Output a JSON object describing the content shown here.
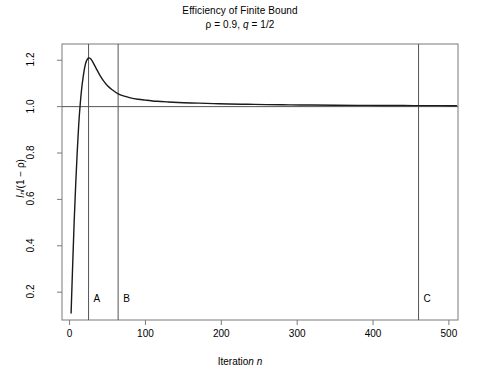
{
  "chart_data": {
    "type": "line",
    "title": "Efficiency of Finite Bound",
    "subtitle": "ρ = 0.9, q = 1/2",
    "xlabel": "Iteration n",
    "ylabel": "Iₙ/(1 − ρ)",
    "xlim": [
      -10,
      512
    ],
    "ylim": [
      0.08,
      1.27
    ],
    "xticks": [
      0,
      100,
      200,
      300,
      400,
      500
    ],
    "xtick_labels": [
      "0",
      "100",
      "200",
      "300",
      "400",
      "500"
    ],
    "yticks": [
      0.2,
      0.4,
      0.6,
      0.8,
      1.0,
      1.2
    ],
    "ytick_labels": [
      "0.2",
      "0.4",
      "0.6",
      "0.8",
      "1.0",
      "1.2"
    ],
    "grid": false,
    "legend": "none",
    "line_color": "#1a1a1a",
    "reference_line_color": "#555555",
    "frame_color": "#7a7a7a",
    "hlines": [
      {
        "y": 1.0,
        "label": "asymptote"
      }
    ],
    "vlines": [
      {
        "x": 25,
        "label": "A"
      },
      {
        "x": 64,
        "label": "B"
      },
      {
        "x": 460,
        "label": "C"
      }
    ],
    "x": [
      2,
      4,
      6,
      8,
      10,
      12,
      14,
      16,
      18,
      20,
      22,
      25,
      28,
      31,
      35,
      40,
      45,
      50,
      56,
      64,
      72,
      80,
      90,
      100,
      115,
      130,
      150,
      170,
      190,
      210,
      235,
      260,
      290,
      320,
      350,
      380,
      410,
      440,
      460,
      480,
      500,
      510
    ],
    "y": [
      0.11,
      0.31,
      0.5,
      0.66,
      0.8,
      0.92,
      1.01,
      1.08,
      1.13,
      1.17,
      1.195,
      1.21,
      1.205,
      1.19,
      1.165,
      1.135,
      1.11,
      1.09,
      1.073,
      1.055,
      1.045,
      1.038,
      1.032,
      1.028,
      1.023,
      1.02,
      1.017,
      1.015,
      1.013,
      1.0115,
      1.01,
      1.0088,
      1.0077,
      1.0068,
      1.0061,
      1.0055,
      1.005,
      1.0046,
      1.0044,
      1.0042,
      1.004,
      1.0039
    ],
    "markers": {
      "A": {
        "x": 25,
        "label": "A",
        "description": "vertical line at peak of curve"
      },
      "B": {
        "x": 64,
        "label": "B",
        "description": "vertical line after decay"
      },
      "C": {
        "x": 460,
        "label": "C",
        "description": "vertical line near right edge"
      }
    }
  }
}
